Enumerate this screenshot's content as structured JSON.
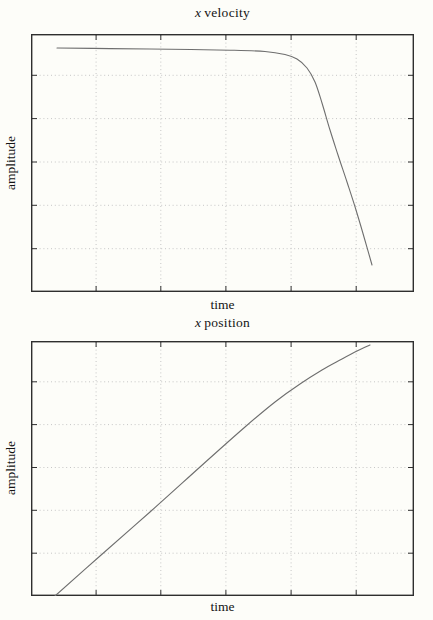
{
  "colors": {
    "background": "#fdfdf9",
    "frame": "#2f2f2f",
    "grid": "#c6c6c6",
    "line": "#6e6e6e",
    "text": "#141414"
  },
  "chart_data": [
    {
      "type": "line",
      "title": "x velocity",
      "title_prefix": "x",
      "title_rest": "velocity",
      "xlabel": "time",
      "ylabel": "amplitude",
      "axes_unlabeled": true,
      "grid": {
        "style": "dotted",
        "inner_gridlines_x": 5,
        "inner_gridlines_y": 5
      },
      "x_ticks": {
        "labels_visible": false,
        "positions_frac": [
          0.17,
          0.339,
          0.509,
          0.679,
          0.849
        ]
      },
      "y_ticks": {
        "labels_visible": false,
        "positions_frac": [
          0.168,
          0.336,
          0.504,
          0.672,
          0.84
        ]
      },
      "legend": "none",
      "series": [
        {
          "name": "x velocity",
          "shape": "flat near maximum then sharp monotonic drop",
          "points_frac": [
            [
              0.0679,
              0.9457
            ],
            [
              0.2063,
              0.9434
            ],
            [
              0.3629,
              0.9411
            ],
            [
              0.5196,
              0.9372
            ],
            [
              0.611,
              0.9322
            ],
            [
              0.6632,
              0.9205
            ],
            [
              0.6945,
              0.9031
            ],
            [
              0.7206,
              0.8682
            ],
            [
              0.7415,
              0.814
            ],
            [
              0.7598,
              0.7326
            ],
            [
              0.7807,
              0.6279
            ],
            [
              0.8016,
              0.531
            ],
            [
              0.8251,
              0.4264
            ],
            [
              0.8486,
              0.3178
            ],
            [
              0.8695,
              0.2132
            ],
            [
              0.8903,
              0.1047
            ]
          ]
        }
      ]
    },
    {
      "type": "line",
      "title": "x position",
      "title_prefix": "x",
      "title_rest": "position",
      "xlabel": "time",
      "ylabel": "amplitude",
      "axes_unlabeled": true,
      "grid": {
        "style": "dotted",
        "inner_gridlines_x": 5,
        "inner_gridlines_y": 5
      },
      "x_ticks": {
        "labels_visible": false,
        "positions_frac": [
          0.17,
          0.339,
          0.509,
          0.679,
          0.849
        ]
      },
      "y_ticks": {
        "labels_visible": false,
        "positions_frac": [
          0.168,
          0.336,
          0.504,
          0.672,
          0.84
        ]
      },
      "legend": "none",
      "series": [
        {
          "name": "x position",
          "shape": "near-linear rise then levels off at top right",
          "points_frac": [
            [
              0.0627,
              0.0
            ],
            [
              0.1801,
              0.1569
            ],
            [
              0.3107,
              0.3294
            ],
            [
              0.4413,
              0.5059
            ],
            [
              0.5587,
              0.6627
            ],
            [
              0.6371,
              0.7608
            ],
            [
              0.7023,
              0.8314
            ],
            [
              0.7598,
              0.8863
            ],
            [
              0.812,
              0.9294
            ],
            [
              0.8512,
              0.9608
            ],
            [
              0.8851,
              0.9843
            ]
          ]
        }
      ]
    }
  ]
}
